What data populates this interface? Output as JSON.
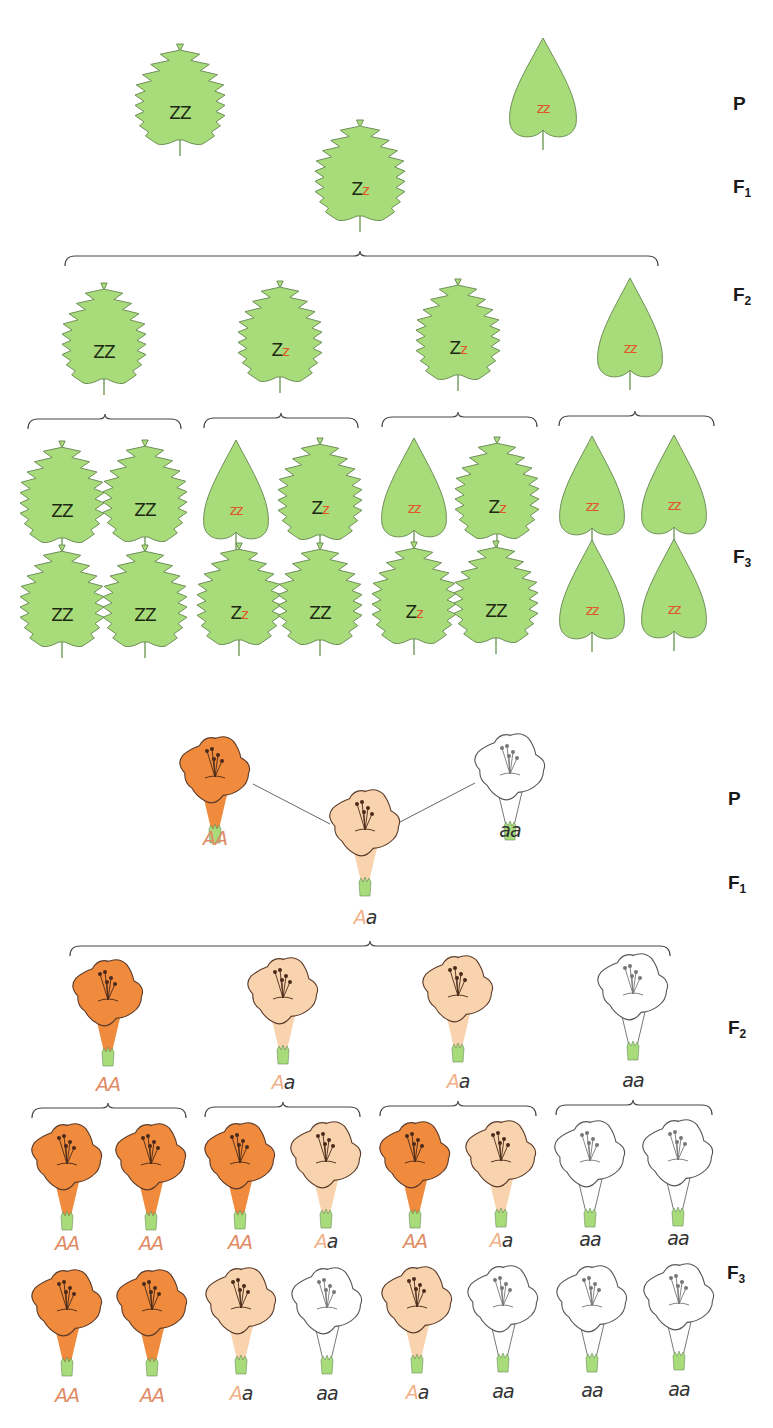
{
  "colors": {
    "leaf_fill": "#a8dc7a",
    "leaf_stroke": "#6e8f58",
    "stem": "#9ab88a",
    "dominant_text": "#1d2a12",
    "recessive_text": "#e0552a",
    "flower_dark": "#f08a3c",
    "flower_light": "#f9d3ad",
    "flower_white": "#ffffff",
    "flower_stroke": "#5a3a2a",
    "calyx": "#a8dc7a",
    "brace": "#444444"
  },
  "leaf_panel": {
    "generation_labels": [
      {
        "id": "P",
        "main": "P",
        "sub": "",
        "x": 733,
        "y": 93
      },
      {
        "id": "F1",
        "main": "F",
        "sub": "1",
        "x": 733,
        "y": 176
      },
      {
        "id": "F2",
        "main": "F",
        "sub": "2",
        "x": 733,
        "y": 284
      },
      {
        "id": "F3",
        "main": "F",
        "sub": "3",
        "x": 733,
        "y": 546
      }
    ],
    "leaves": [
      {
        "gen": "P",
        "shape": "serrated",
        "cx": 180,
        "top": 44,
        "h": 112,
        "w": 78,
        "genotype": [
          [
            "Z",
            "dom"
          ],
          [
            "Z",
            "dom"
          ]
        ]
      },
      {
        "gen": "P",
        "shape": "smooth",
        "cx": 543,
        "top": 38,
        "h": 112,
        "w": 66,
        "genotype": [
          [
            "z",
            "rec"
          ],
          [
            "z",
            "rec"
          ]
        ]
      },
      {
        "gen": "F1",
        "shape": "serrated",
        "cx": 360,
        "top": 120,
        "h": 112,
        "w": 78,
        "genotype": [
          [
            "Z",
            "dom"
          ],
          [
            "z",
            "rec"
          ]
        ]
      },
      {
        "gen": "F2",
        "shape": "serrated",
        "cx": 104,
        "top": 283,
        "h": 112,
        "w": 72,
        "genotype": [
          [
            "Z",
            "dom"
          ],
          [
            "Z",
            "dom"
          ]
        ]
      },
      {
        "gen": "F2",
        "shape": "serrated",
        "cx": 280,
        "top": 281,
        "h": 112,
        "w": 72,
        "genotype": [
          [
            "Z",
            "dom"
          ],
          [
            "z",
            "rec"
          ]
        ]
      },
      {
        "gen": "F2",
        "shape": "serrated",
        "cx": 458,
        "top": 279,
        "h": 112,
        "w": 72,
        "genotype": [
          [
            "Z",
            "dom"
          ],
          [
            "z",
            "rec"
          ]
        ]
      },
      {
        "gen": "F2",
        "shape": "smooth",
        "cx": 630,
        "top": 278,
        "h": 112,
        "w": 64,
        "genotype": [
          [
            "z",
            "rec"
          ],
          [
            "z",
            "rec"
          ]
        ]
      },
      {
        "gen": "F3",
        "shape": "serrated",
        "cx": 62,
        "top": 441,
        "h": 113,
        "w": 72,
        "genotype": [
          [
            "Z",
            "dom"
          ],
          [
            "Z",
            "dom"
          ]
        ]
      },
      {
        "gen": "F3",
        "shape": "serrated",
        "cx": 145,
        "top": 440,
        "h": 113,
        "w": 72,
        "genotype": [
          [
            "Z",
            "dom"
          ],
          [
            "Z",
            "dom"
          ]
        ]
      },
      {
        "gen": "F3",
        "shape": "smooth",
        "cx": 236,
        "top": 440,
        "h": 112,
        "w": 64,
        "genotype": [
          [
            "z",
            "rec"
          ],
          [
            "z",
            "rec"
          ]
        ]
      },
      {
        "gen": "F3",
        "shape": "serrated",
        "cx": 320,
        "top": 438,
        "h": 113,
        "w": 72,
        "genotype": [
          [
            "Z",
            "dom"
          ],
          [
            "z",
            "rec"
          ]
        ]
      },
      {
        "gen": "F3",
        "shape": "smooth",
        "cx": 414,
        "top": 438,
        "h": 112,
        "w": 64,
        "genotype": [
          [
            "z",
            "rec"
          ],
          [
            "z",
            "rec"
          ]
        ]
      },
      {
        "gen": "F3",
        "shape": "serrated",
        "cx": 497,
        "top": 437,
        "h": 113,
        "w": 72,
        "genotype": [
          [
            "Z",
            "dom"
          ],
          [
            "z",
            "rec"
          ]
        ]
      },
      {
        "gen": "F3",
        "shape": "smooth",
        "cx": 592,
        "top": 436,
        "h": 112,
        "w": 64,
        "genotype": [
          [
            "z",
            "rec"
          ],
          [
            "z",
            "rec"
          ]
        ]
      },
      {
        "gen": "F3",
        "shape": "smooth",
        "cx": 674,
        "top": 435,
        "h": 112,
        "w": 64,
        "genotype": [
          [
            "z",
            "rec"
          ],
          [
            "z",
            "rec"
          ]
        ]
      },
      {
        "gen": "F3",
        "shape": "serrated",
        "cx": 62,
        "top": 545,
        "h": 113,
        "w": 72,
        "genotype": [
          [
            "Z",
            "dom"
          ],
          [
            "Z",
            "dom"
          ]
        ]
      },
      {
        "gen": "F3",
        "shape": "serrated",
        "cx": 145,
        "top": 545,
        "h": 113,
        "w": 72,
        "genotype": [
          [
            "Z",
            "dom"
          ],
          [
            "Z",
            "dom"
          ]
        ]
      },
      {
        "gen": "F3",
        "shape": "serrated",
        "cx": 239,
        "top": 543,
        "h": 113,
        "w": 72,
        "genotype": [
          [
            "Z",
            "dom"
          ],
          [
            "z",
            "rec"
          ]
        ]
      },
      {
        "gen": "F3",
        "shape": "serrated",
        "cx": 320,
        "top": 543,
        "h": 113,
        "w": 72,
        "genotype": [
          [
            "Z",
            "dom"
          ],
          [
            "Z",
            "dom"
          ]
        ]
      },
      {
        "gen": "F3",
        "shape": "serrated",
        "cx": 414,
        "top": 542,
        "h": 113,
        "w": 72,
        "genotype": [
          [
            "Z",
            "dom"
          ],
          [
            "z",
            "rec"
          ]
        ]
      },
      {
        "gen": "F3",
        "shape": "serrated",
        "cx": 496,
        "top": 541,
        "h": 113,
        "w": 72,
        "genotype": [
          [
            "Z",
            "dom"
          ],
          [
            "Z",
            "dom"
          ]
        ]
      },
      {
        "gen": "F3",
        "shape": "smooth",
        "cx": 592,
        "top": 540,
        "h": 112,
        "w": 64,
        "genotype": [
          [
            "z",
            "rec"
          ],
          [
            "z",
            "rec"
          ]
        ]
      },
      {
        "gen": "F3",
        "shape": "smooth",
        "cx": 674,
        "top": 539,
        "h": 112,
        "w": 64,
        "genotype": [
          [
            "z",
            "rec"
          ],
          [
            "z",
            "rec"
          ]
        ]
      }
    ],
    "braces": [
      {
        "x1": 65,
        "x2": 658,
        "tip": 360,
        "y": 256
      },
      {
        "x1": 28,
        "x2": 181,
        "tip": 105,
        "y": 419
      },
      {
        "x1": 204,
        "x2": 358,
        "tip": 281,
        "y": 418
      },
      {
        "x1": 382,
        "x2": 537,
        "tip": 458,
        "y": 417
      },
      {
        "x1": 559,
        "x2": 714,
        "tip": 635,
        "y": 416
      }
    ]
  },
  "flower_panel": {
    "generation_labels": [
      {
        "id": "P",
        "main": "P",
        "sub": "",
        "x": 728,
        "y": 788
      },
      {
        "id": "F1",
        "main": "F",
        "sub": "1",
        "x": 728,
        "y": 872
      },
      {
        "id": "F2",
        "main": "F",
        "sub": "2",
        "x": 728,
        "y": 1017
      },
      {
        "id": "F3",
        "main": "F",
        "sub": "3",
        "x": 727,
        "y": 1262
      }
    ],
    "cross_lines": [
      {
        "x1": 253,
        "y1": 784,
        "x2": 330,
        "y2": 824
      },
      {
        "x1": 400,
        "y1": 822,
        "x2": 475,
        "y2": 783
      }
    ],
    "flowers": [
      {
        "gen": "P",
        "color": "dark",
        "cx": 215,
        "top": 737,
        "label_y": 838,
        "genotype": [
          [
            "A",
            "dom"
          ],
          [
            "A",
            "dom"
          ]
        ]
      },
      {
        "gen": "P",
        "color": "white",
        "cx": 510,
        "top": 734,
        "label_y": 830,
        "genotype": [
          [
            "a",
            "rec"
          ],
          [
            "a",
            "rec"
          ]
        ]
      },
      {
        "gen": "F1",
        "color": "light",
        "cx": 365,
        "top": 790,
        "label_y": 917,
        "genotype": [
          [
            "A",
            "het"
          ],
          [
            "a",
            "rec"
          ]
        ]
      },
      {
        "gen": "F2",
        "color": "dark",
        "cx": 108,
        "top": 960,
        "label_y": 1084,
        "genotype": [
          [
            "A",
            "dom"
          ],
          [
            "A",
            "dom"
          ]
        ]
      },
      {
        "gen": "F2",
        "color": "light",
        "cx": 283,
        "top": 958,
        "label_y": 1082,
        "genotype": [
          [
            "A",
            "het"
          ],
          [
            "a",
            "rec"
          ]
        ]
      },
      {
        "gen": "F2",
        "color": "light",
        "cx": 458,
        "top": 956,
        "label_y": 1081,
        "genotype": [
          [
            "A",
            "het"
          ],
          [
            "a",
            "rec"
          ]
        ]
      },
      {
        "gen": "F2",
        "color": "white",
        "cx": 633,
        "top": 954,
        "label_y": 1080,
        "genotype": [
          [
            "a",
            "rec"
          ],
          [
            "a",
            "rec"
          ]
        ]
      },
      {
        "gen": "F3",
        "color": "dark",
        "cx": 67,
        "top": 1124,
        "label_y": 1243,
        "genotype": [
          [
            "A",
            "dom"
          ],
          [
            "A",
            "dom"
          ]
        ]
      },
      {
        "gen": "F3",
        "color": "dark",
        "cx": 151,
        "top": 1124,
        "label_y": 1243,
        "genotype": [
          [
            "A",
            "dom"
          ],
          [
            "A",
            "dom"
          ]
        ]
      },
      {
        "gen": "F3",
        "color": "dark",
        "cx": 240,
        "top": 1123,
        "label_y": 1242,
        "genotype": [
          [
            "A",
            "dom"
          ],
          [
            "A",
            "dom"
          ]
        ]
      },
      {
        "gen": "F3",
        "color": "light",
        "cx": 326,
        "top": 1122,
        "label_y": 1241,
        "genotype": [
          [
            "A",
            "het"
          ],
          [
            "a",
            "rec"
          ]
        ]
      },
      {
        "gen": "F3",
        "color": "dark",
        "cx": 415,
        "top": 1122,
        "label_y": 1241,
        "genotype": [
          [
            "A",
            "dom"
          ],
          [
            "A",
            "dom"
          ]
        ]
      },
      {
        "gen": "F3",
        "color": "light",
        "cx": 501,
        "top": 1121,
        "label_y": 1240,
        "genotype": [
          [
            "A",
            "het"
          ],
          [
            "a",
            "rec"
          ]
        ]
      },
      {
        "gen": "F3",
        "color": "white",
        "cx": 590,
        "top": 1121,
        "label_y": 1239,
        "genotype": [
          [
            "a",
            "rec"
          ],
          [
            "a",
            "rec"
          ]
        ]
      },
      {
        "gen": "F3",
        "color": "white",
        "cx": 678,
        "top": 1120,
        "label_y": 1238,
        "genotype": [
          [
            "a",
            "rec"
          ],
          [
            "a",
            "rec"
          ]
        ]
      },
      {
        "gen": "F3",
        "color": "dark",
        "cx": 67,
        "top": 1270,
        "label_y": 1395,
        "genotype": [
          [
            "A",
            "dom"
          ],
          [
            "A",
            "dom"
          ]
        ]
      },
      {
        "gen": "F3",
        "color": "dark",
        "cx": 152,
        "top": 1270,
        "label_y": 1395,
        "genotype": [
          [
            "A",
            "dom"
          ],
          [
            "A",
            "dom"
          ]
        ]
      },
      {
        "gen": "F3",
        "color": "light",
        "cx": 241,
        "top": 1268,
        "label_y": 1393,
        "genotype": [
          [
            "A",
            "het"
          ],
          [
            "a",
            "rec"
          ]
        ]
      },
      {
        "gen": "F3",
        "color": "white",
        "cx": 327,
        "top": 1268,
        "label_y": 1393,
        "genotype": [
          [
            "a",
            "rec"
          ],
          [
            "a",
            "rec"
          ]
        ]
      },
      {
        "gen": "F3",
        "color": "light",
        "cx": 417,
        "top": 1267,
        "label_y": 1392,
        "genotype": [
          [
            "A",
            "het"
          ],
          [
            "a",
            "rec"
          ]
        ]
      },
      {
        "gen": "F3",
        "color": "white",
        "cx": 503,
        "top": 1266,
        "label_y": 1391,
        "genotype": [
          [
            "a",
            "rec"
          ],
          [
            "a",
            "rec"
          ]
        ]
      },
      {
        "gen": "F3",
        "color": "white",
        "cx": 592,
        "top": 1266,
        "label_y": 1390,
        "genotype": [
          [
            "a",
            "rec"
          ],
          [
            "a",
            "rec"
          ]
        ]
      },
      {
        "gen": "F3",
        "color": "white",
        "cx": 679,
        "top": 1264,
        "label_y": 1389,
        "genotype": [
          [
            "a",
            "rec"
          ],
          [
            "a",
            "rec"
          ]
        ]
      }
    ],
    "braces": [
      {
        "x1": 70,
        "x2": 670,
        "tip": 370,
        "y": 946
      },
      {
        "x1": 32,
        "x2": 186,
        "tip": 108,
        "y": 1108
      },
      {
        "x1": 205,
        "x2": 360,
        "tip": 283,
        "y": 1107
      },
      {
        "x1": 380,
        "x2": 536,
        "tip": 458,
        "y": 1106
      },
      {
        "x1": 556,
        "x2": 712,
        "tip": 633,
        "y": 1105
      }
    ]
  }
}
